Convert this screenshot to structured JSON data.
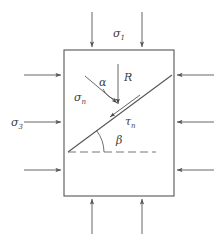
{
  "figure": {
    "type": "mechanics-free-body-diagram",
    "background_color": "#ffffff",
    "line_color": "#555555",
    "text_color": "#404040"
  },
  "block": {
    "name": "rectangular-specimen",
    "left": 64,
    "top": 50,
    "right": 174,
    "bottom": 196
  },
  "labels": {
    "sigma1": {
      "text": "σ",
      "sub": "1",
      "x": 118,
      "y": 33
    },
    "sigma3": {
      "text": "σ",
      "sub": "3",
      "x": 16,
      "y": 122
    },
    "sigma_n": {
      "text": "σ",
      "sub": "n",
      "x": 79,
      "y": 98
    },
    "tau_n": {
      "text": "τ",
      "sub": "n",
      "x": 127,
      "y": 122
    },
    "resultant": {
      "text": "R",
      "sub": "",
      "x": 128,
      "y": 77
    },
    "alpha": {
      "text": "α",
      "sub": "",
      "x": 103,
      "y": 82
    },
    "beta": {
      "text": "β",
      "sub": "",
      "x": 120,
      "y": 140
    }
  },
  "arrows": {
    "top": {
      "name": "sigma1-arrows",
      "label": "σ1",
      "direction": "down",
      "count": 2,
      "x_positions": [
        92,
        142
      ],
      "tail_y": 12,
      "head_y": 49
    },
    "bottom": {
      "name": "sigma1-arrows-bottom",
      "direction": "up",
      "count": 2,
      "x_positions": [
        92,
        142
      ],
      "tail_y": 234,
      "head_y": 197
    },
    "left": {
      "name": "sigma3-arrows",
      "label": "σ3",
      "direction": "right",
      "count": 3,
      "y_positions": [
        75,
        122,
        170
      ],
      "tail_x": 24,
      "head_x": 63
    },
    "right": {
      "name": "sigma3-arrows-right",
      "direction": "left",
      "count": 3,
      "y_positions": [
        75,
        122,
        170
      ],
      "tail_x": 214,
      "head_x": 175
    }
  },
  "fracture_plane": {
    "name": "inclined-failure-plane",
    "x1": 68,
    "y1": 152,
    "x2": 172,
    "y2": 75
  },
  "reference_line": {
    "name": "horizontal-dashed-reference",
    "x1": 68,
    "y1": 152,
    "x2": 156,
    "y2": 152,
    "style": "dashed"
  },
  "vectors": {
    "resultant_R": {
      "name": "resultant-force-vector",
      "x1": 118,
      "y1": 64,
      "x2": 118,
      "y2": 104
    },
    "normal_sigma_n": {
      "name": "normal-stress-vector",
      "x1": 85,
      "y1": 76,
      "x2": 118,
      "y2": 104
    },
    "shear_tau_n": {
      "name": "shear-stress-vector",
      "x1": 140,
      "y1": 95,
      "x2": 110,
      "y2": 118
    }
  },
  "angles": {
    "alpha_arc": {
      "name": "alpha-angle-arc",
      "description": "angle between sigma_n and R at intersection"
    },
    "beta_arc": {
      "name": "beta-angle-arc",
      "description": "dip angle between failure plane and horizontal"
    }
  }
}
